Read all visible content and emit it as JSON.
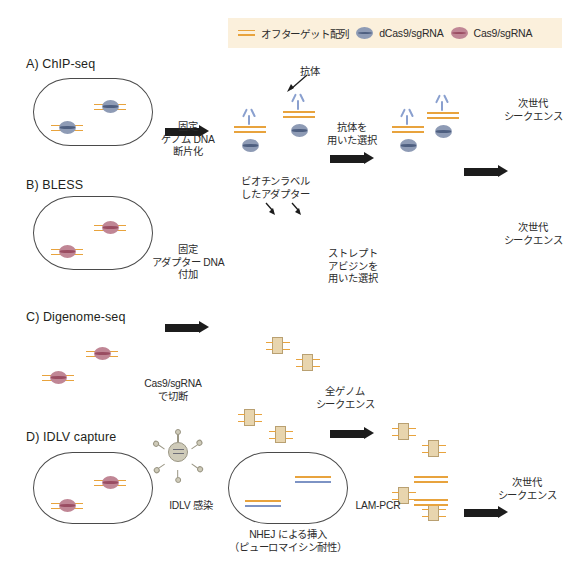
{
  "legend": {
    "items": [
      {
        "icon": "offtarget-lines-icon",
        "label": "オフターゲット配列"
      },
      {
        "icon": "dcas9-protein-icon",
        "label": "dCas9/sgRNA"
      },
      {
        "icon": "cas9-protein-icon",
        "label": "Cas9/sgRNA"
      }
    ]
  },
  "colors": {
    "offtarget_orange": "#e8a33d",
    "dna_gray": "#6e6e78",
    "dcas9_blue": "#8e9bb5",
    "cas9_red": "#c08695",
    "antibody_blue": "#8aa0cf",
    "adapter_tan": "#e8d5ae",
    "legend_background": "#fbf0dc",
    "arrow_black": "#1c1c1c"
  },
  "panels": [
    {
      "id": "chip-seq",
      "title": "A) ChIP-seq",
      "annotation": "抗体",
      "steps": [
        {
          "caption": "固定\nゲノム DNA\n断片化"
        },
        {
          "caption": "抗体を\n用いた選択"
        },
        {
          "caption": "次世代\nシークエンス"
        }
      ],
      "step1_lines": [
        "固定",
        "ゲノム DNA",
        "断片化"
      ],
      "step2_lines": [
        "抗体を",
        "用いた選択"
      ],
      "result_lines": [
        "次世代",
        "シークエンス"
      ]
    },
    {
      "id": "bless",
      "title": "B) BLESS",
      "annotation_lines": [
        "ビオチンラベル",
        "したアダプター"
      ],
      "step1_lines": [
        "固定",
        "アダプター DNA",
        "付加"
      ],
      "step2_lines": [
        "ストレプト",
        "アビジンを",
        "用いた選択"
      ],
      "result_lines": [
        "次世代",
        "シークエンス"
      ]
    },
    {
      "id": "digenome-seq",
      "title": "C) Digenome-seq",
      "step1_lines": [
        "Cas9/sgRNA",
        "で切断"
      ],
      "step2_lines": [
        "全ゲノム",
        "シークエンス"
      ]
    },
    {
      "id": "idlv-capture",
      "title": "D) IDLV capture",
      "step1_lines": [
        "IDLV 感染"
      ],
      "step1_sub_lines": [
        "NHEJ による挿入",
        "（ピューロマイシン耐性）"
      ],
      "step2_lines": [
        "LAM-PCR"
      ],
      "result_lines": [
        "次世代",
        "シークエンス"
      ]
    }
  ]
}
